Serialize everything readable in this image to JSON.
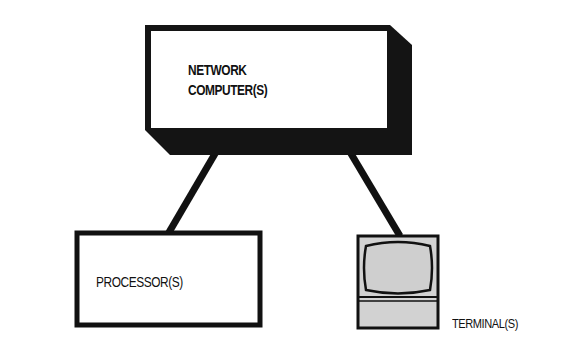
{
  "diagram": {
    "type": "network topology",
    "nodes": [
      {
        "id": "network_computer",
        "label_line1": "NETWORK",
        "label_line2": "COMPUTER(S)",
        "shape": "3d-box"
      },
      {
        "id": "processor",
        "label": "PROCESSOR(S)",
        "shape": "box"
      },
      {
        "id": "terminal",
        "label": "TERMINAL(S)",
        "shape": "terminal-icon"
      }
    ],
    "edges": [
      {
        "from": "network_computer",
        "to": "processor"
      },
      {
        "from": "network_computer",
        "to": "terminal"
      }
    ],
    "colors": {
      "stroke": "#111111",
      "shadow": "#141414",
      "screen_fill": "#cfcfcf",
      "background": "#ffffff"
    }
  }
}
